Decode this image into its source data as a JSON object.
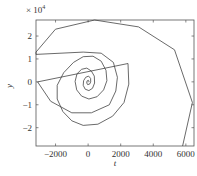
{
  "chart_data": {
    "type": "line",
    "title": "",
    "xlabel": "t",
    "ylabel": "y",
    "y_multiplier": "× 10^4",
    "xlim": [
      -3200,
      6500
    ],
    "ylim": [
      -2.8,
      2.7
    ],
    "x_ticks": [
      -2000,
      0,
      2000,
      4000,
      6000
    ],
    "x_tick_labels": [
      "-2000",
      "0",
      "2000",
      "4000",
      "6000"
    ],
    "y_ticks": [
      -2,
      -1,
      0,
      1,
      2
    ],
    "y_tick_labels": [
      "-2",
      "-1",
      "0",
      "1",
      "2"
    ],
    "grid": false,
    "legend": null,
    "series": [
      {
        "name": "spiral",
        "color": "#444444",
        "points": [
          [
            0,
            -0.02
          ],
          [
            60,
            0.03
          ],
          [
            20,
            0.07
          ],
          [
            -60,
            0.04
          ],
          [
            -90,
            -0.04
          ],
          [
            -30,
            -0.12
          ],
          [
            90,
            -0.1
          ],
          [
            160,
            0.0
          ],
          [
            150,
            0.15
          ],
          [
            30,
            0.25
          ],
          [
            -150,
            0.2
          ],
          [
            -280,
            0.05
          ],
          [
            -300,
            -0.15
          ],
          [
            -180,
            -0.32
          ],
          [
            50,
            -0.38
          ],
          [
            270,
            -0.28
          ],
          [
            400,
            -0.05
          ],
          [
            380,
            0.25
          ],
          [
            200,
            0.47
          ],
          [
            -80,
            0.6
          ],
          [
            -400,
            0.55
          ],
          [
            -680,
            0.35
          ],
          [
            -800,
            0.02
          ],
          [
            -700,
            -0.35
          ],
          [
            -400,
            -0.62
          ],
          [
            50,
            -0.75
          ],
          [
            550,
            -0.65
          ],
          [
            950,
            -0.35
          ],
          [
            1150,
            0.05
          ],
          [
            1100,
            0.5
          ],
          [
            800,
            0.9
          ],
          [
            300,
            1.12
          ],
          [
            -300,
            1.1
          ],
          [
            -900,
            0.85
          ],
          [
            -1500,
            0.4
          ],
          [
            -1900,
            -0.15
          ],
          [
            -1900,
            -0.75
          ],
          [
            -1550,
            -1.3
          ],
          [
            -1000,
            -1.7
          ],
          [
            -300,
            -1.9
          ],
          [
            600,
            -1.85
          ],
          [
            1500,
            -1.5
          ],
          [
            2200,
            -0.9
          ],
          [
            2500,
            -0.1
          ],
          [
            2450,
            0.8
          ],
          [
            -3100,
            0.0
          ],
          [
            -2300,
            -0.85
          ],
          [
            -1000,
            -1.35
          ],
          [
            200,
            -1.35
          ],
          [
            1300,
            -1.0
          ],
          [
            1700,
            -0.4
          ],
          [
            1800,
            0.2
          ],
          [
            1550,
            0.85
          ],
          [
            800,
            1.25
          ],
          [
            -300,
            1.3
          ],
          [
            -3200,
            1.2
          ],
          [
            -3200,
            1.3
          ],
          [
            -2000,
            2.3
          ],
          [
            400,
            2.7
          ],
          [
            3100,
            2.4
          ],
          [
            5300,
            1.4
          ],
          [
            6400,
            -0.9
          ],
          [
            5800,
            -2.8
          ]
        ]
      }
    ]
  }
}
